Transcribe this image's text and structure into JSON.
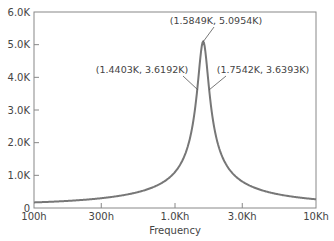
{
  "chart_data": {
    "type": "line",
    "title": "",
    "xlabel": "Frequency",
    "ylabel": "",
    "x_scale": "log",
    "xlim": [
      100,
      10000
    ],
    "ylim": [
      0,
      6000
    ],
    "grid": false,
    "legend": null,
    "x_ticks": [
      {
        "value": 100,
        "label": "100h"
      },
      {
        "value": 300,
        "label": "300h"
      },
      {
        "value": 1000,
        "label": "1.0Kh"
      },
      {
        "value": 3000,
        "label": "3.0Kh"
      },
      {
        "value": 10000,
        "label": "10Kh"
      }
    ],
    "y_ticks": [
      {
        "value": 0,
        "label": "0"
      },
      {
        "value": 1000,
        "label": "1.0K"
      },
      {
        "value": 2000,
        "label": "2.0K"
      },
      {
        "value": 3000,
        "label": "3.0K"
      },
      {
        "value": 4000,
        "label": "4.0K"
      },
      {
        "value": 5000,
        "label": "5.0K"
      },
      {
        "value": 6000,
        "label": "6.0K"
      }
    ],
    "series": [
      {
        "name": "response",
        "color": "#777777",
        "x": [
          100,
          200,
          300,
          500,
          700,
          1000,
          1200,
          1300,
          1400,
          1440,
          1500,
          1550,
          1584.9,
          1620,
          1680,
          1754.2,
          1850,
          2000,
          2500,
          3000,
          4000,
          6000,
          10000
        ],
        "y": [
          160,
          200,
          250,
          380,
          540,
          880,
          1450,
          2050,
          3100,
          3619.2,
          4450,
          4950,
          5095.4,
          4950,
          4350,
          3639.3,
          2750,
          1900,
          1000,
          720,
          480,
          310,
          160
        ]
      }
    ],
    "annotations": [
      {
        "text": "(1.5849K, 5.0954K)",
        "x": 1584.9,
        "y": 5095.4
      },
      {
        "text": "(1.4403K, 3.6192K)",
        "x": 1440.3,
        "y": 3619.2
      },
      {
        "text": "(1.7542K, 3.6393K)",
        "x": 1754.2,
        "y": 3639.3
      }
    ]
  }
}
